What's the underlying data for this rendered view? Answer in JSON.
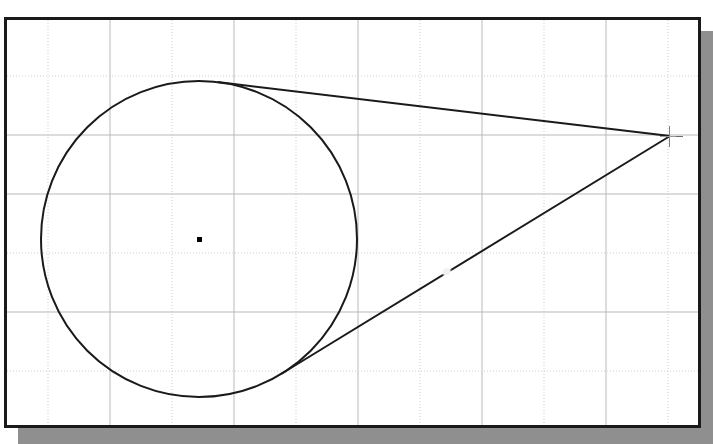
{
  "application": {
    "type": "cad-drawing-canvas",
    "canvas_background": "#ffffff",
    "border_color": "#1a1a1a",
    "shadow_color": "#8f8f8f"
  },
  "grid": {
    "visible": true,
    "major_color": "#b9b9b9",
    "minor_color": "#d8d8d8",
    "dotted_color": "#cfcfcf",
    "vertical_spacing_px": 62,
    "horizontal_spacing_px": 59,
    "vertical_lines_x": [
      41,
      103,
      165,
      227,
      289,
      351,
      413,
      475,
      537,
      599,
      661
    ],
    "horizontal_lines_y": [
      56,
      115,
      174,
      233,
      292,
      351
    ],
    "dotted_vertical_x": [
      41,
      165,
      289,
      413,
      537,
      661
    ],
    "dotted_horizontal_y": [
      56,
      233,
      351
    ]
  },
  "geometry": {
    "stroke_color": "#1a1a1a",
    "stroke_width": 2,
    "circle": {
      "name": "construction-circle",
      "center_x": 192,
      "center_y": 219,
      "radius": 158
    },
    "apex": {
      "name": "tangent-apex-point",
      "x": 663,
      "y": 116
    },
    "tangent_upper": {
      "name": "upper-tangent-line",
      "touch_x": 226,
      "touch_y": 63,
      "end_x": 663,
      "end_y": 116
    },
    "tangent_lower": {
      "name": "lower-tangent-line",
      "touch_x": 296,
      "touch_y": 338,
      "end_x": 663,
      "end_y": 116
    },
    "center_marker": {
      "name": "circle-center-marker",
      "x": 192,
      "y": 219,
      "size": 5,
      "color": "#000000"
    },
    "snap_gap_marker": {
      "name": "snap-point-marker",
      "x": 439,
      "y": 251
    },
    "crosshair_cursor": {
      "name": "crosshair-cursor",
      "x": 663,
      "y": 116,
      "color": "#7d7d7d"
    }
  }
}
